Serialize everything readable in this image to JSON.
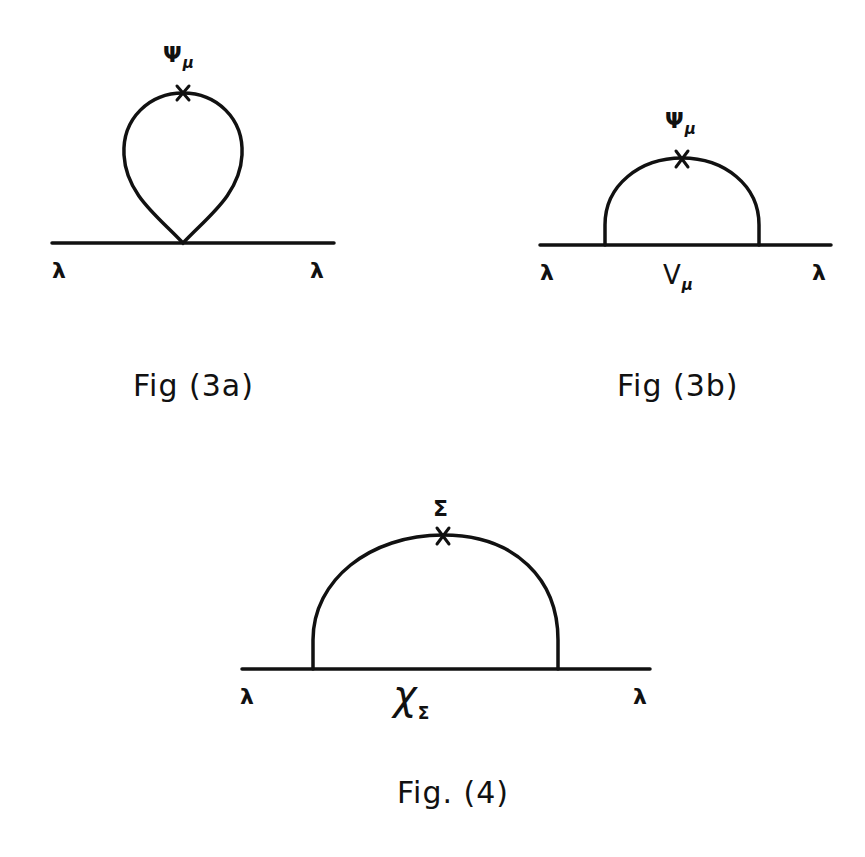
{
  "figures": [
    {
      "id": "fig3a",
      "caption": "Fig (3a)",
      "external_left": "λ",
      "external_right": "λ",
      "insertion_label": "Ψ",
      "insertion_sub": "μ",
      "topology": "tadpole loop attached at single vertex"
    },
    {
      "id": "fig3b",
      "caption": "Fig (3b)",
      "external_left": "λ",
      "external_right": "λ",
      "insertion_label": "Ψ",
      "insertion_sub": "μ",
      "internal_label": "V",
      "internal_sub": "μ",
      "topology": "semicircle loop between two vertices"
    },
    {
      "id": "fig4",
      "caption": "Fig. (4)",
      "external_left": "λ",
      "external_right": "λ",
      "insertion_label": "Σ",
      "internal_label": "χ",
      "internal_sub": "Σ",
      "topology": "semicircle loop between two vertices"
    }
  ],
  "colors": {
    "ink": "#111111",
    "background": "#ffffff"
  }
}
